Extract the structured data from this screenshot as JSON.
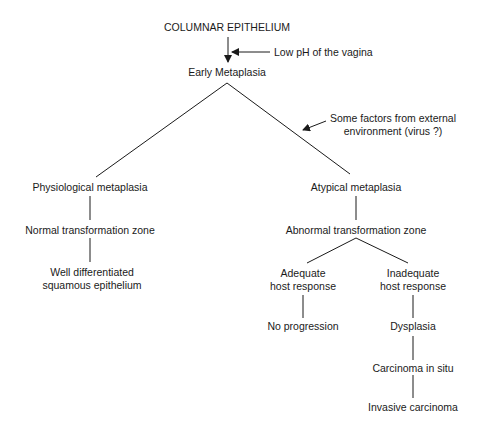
{
  "diagram": {
    "type": "flowchart-tree",
    "nodes": {
      "columnar": "COLUMNAR EPITHELIUM",
      "early": "Early Metaplasia",
      "physiological": "Physiological metaplasia",
      "normal_tz": "Normal transformation zone",
      "well_diff_1": "Well differentiated",
      "well_diff_2": "squamous epithelium",
      "atypical": "Atypical metaplasia",
      "abnormal_tz": "Abnormal transformation zone",
      "adequate_1": "Adequate",
      "adequate_2": "host response",
      "inadequate_1": "Inadequate",
      "inadequate_2": "host response",
      "no_progression": "No progression",
      "dysplasia": "Dysplasia",
      "cis": "Carcinoma in situ",
      "invasive": "Invasive carcinoma"
    },
    "annotations": {
      "low_ph": "Low pH of the vagina",
      "external_1": "Some factors from external",
      "external_2": "environment (virus ?)"
    },
    "colors": {
      "ink": "#1a1a1a",
      "background": "#ffffff"
    }
  }
}
